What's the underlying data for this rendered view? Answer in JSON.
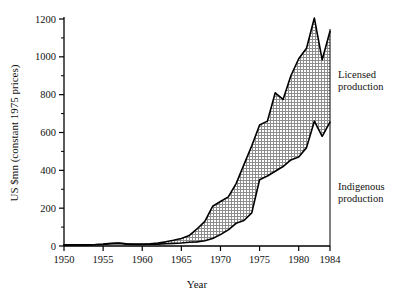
{
  "chart_data": {
    "type": "area",
    "title": "",
    "xlabel": "Year",
    "ylabel": "US $mn (constant 1975 prices)",
    "xlim": [
      1950,
      1984
    ],
    "ylim": [
      0,
      1200
    ],
    "xticks": [
      1950,
      1955,
      1960,
      1965,
      1970,
      1975,
      1980,
      1984
    ],
    "xtick_labels": [
      "1950",
      "1955",
      "1960",
      "1965",
      "1970",
      "1975",
      "1980",
      "1984"
    ],
    "yticks": [
      0,
      200,
      400,
      600,
      800,
      1000,
      1200
    ],
    "ytick_labels": [
      "0",
      "200",
      "400",
      "600",
      "800",
      "1000",
      "1200"
    ],
    "minor_ytick_step": 100,
    "grid": false,
    "legend_position": "right-inside",
    "fill_style": "cross-hatch",
    "x": [
      1950,
      1951,
      1952,
      1953,
      1954,
      1955,
      1956,
      1957,
      1958,
      1959,
      1960,
      1961,
      1962,
      1963,
      1964,
      1965,
      1966,
      1967,
      1968,
      1969,
      1970,
      1971,
      1972,
      1973,
      1974,
      1975,
      1976,
      1977,
      1978,
      1979,
      1980,
      1981,
      1982,
      1983,
      1984
    ],
    "series": [
      {
        "name": "Indigenous production",
        "label": "Indigenous\nproduction",
        "label_line1": "Indigenous",
        "label_line2": "production",
        "values": [
          5,
          5,
          6,
          6,
          7,
          8,
          12,
          14,
          10,
          8,
          8,
          9,
          10,
          12,
          14,
          16,
          20,
          22,
          28,
          40,
          60,
          85,
          120,
          135,
          175,
          350,
          370,
          395,
          420,
          455,
          470,
          520,
          660,
          580,
          655
        ]
      },
      {
        "name": "Licensed production",
        "label": "Licensed\nproduction",
        "label_line1": "Licensed",
        "label_line2": "production",
        "values": [
          6,
          6,
          7,
          7,
          8,
          10,
          14,
          16,
          12,
          10,
          10,
          12,
          16,
          22,
          30,
          40,
          55,
          90,
          130,
          210,
          235,
          260,
          330,
          430,
          530,
          640,
          660,
          810,
          775,
          900,
          990,
          1045,
          1205,
          985,
          1135
        ]
      }
    ],
    "annotations": [
      {
        "text": "Licensed production",
        "x": 1984,
        "y": 900
      },
      {
        "text": "Indigenous production",
        "x": 1984,
        "y": 330
      }
    ]
  },
  "axis": {
    "x_label": "Year",
    "y_label": "US $mn (constant 1975 prices)"
  },
  "colors": {
    "line": "#000000",
    "fill": "#9a9a9a",
    "background": "#ffffff",
    "text": "#111111"
  }
}
